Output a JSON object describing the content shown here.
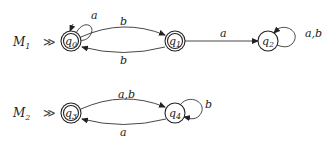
{
  "machines": [
    {
      "name": "M",
      "sub": "1",
      "start_marker": "≫",
      "states": [
        {
          "id": "q0",
          "base": "q",
          "sub": "0",
          "accepting": true,
          "start": true
        },
        {
          "id": "q1",
          "base": "q",
          "sub": "1",
          "accepting": true,
          "start": false
        },
        {
          "id": "q2",
          "base": "q",
          "sub": "2",
          "accepting": false,
          "start": false
        }
      ],
      "transitions": [
        {
          "from": "q0",
          "to": "q0",
          "label": "a"
        },
        {
          "from": "q0",
          "to": "q1",
          "label": "b"
        },
        {
          "from": "q1",
          "to": "q0",
          "label": "b"
        },
        {
          "from": "q1",
          "to": "q2",
          "label": "a"
        },
        {
          "from": "q2",
          "to": "q2",
          "label": "a,b"
        }
      ]
    },
    {
      "name": "M",
      "sub": "2",
      "start_marker": "≫",
      "states": [
        {
          "id": "q3",
          "base": "q",
          "sub": "3",
          "accepting": true,
          "start": true
        },
        {
          "id": "q4",
          "base": "q",
          "sub": "4",
          "accepting": false,
          "start": false
        }
      ],
      "transitions": [
        {
          "from": "q3",
          "to": "q4",
          "label": "a,b"
        },
        {
          "from": "q4",
          "to": "q3",
          "label": "a"
        },
        {
          "from": "q4",
          "to": "q4",
          "label": "b"
        }
      ]
    }
  ]
}
